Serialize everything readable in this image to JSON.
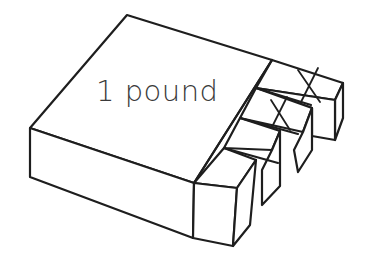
{
  "diagram": {
    "label": "1 pound",
    "colors": {
      "stroke": "#1e1e1e",
      "background": "#ffffff",
      "text": "#3a3a3a"
    },
    "small_blocks": {
      "count": 4,
      "crossed_out": 2
    }
  }
}
